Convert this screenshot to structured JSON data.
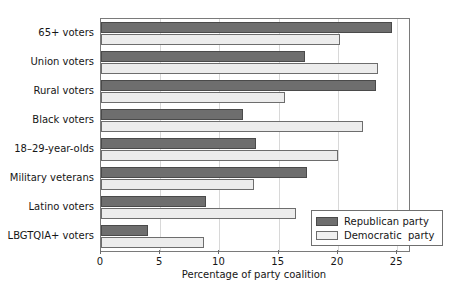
{
  "chart_data": {
    "type": "bar",
    "orientation": "horizontal",
    "title": "",
    "xlabel": "Percentage of party coalition",
    "ylabel": "",
    "xlim": [
      0,
      26
    ],
    "xticks": [
      0,
      5,
      10,
      15,
      20,
      25
    ],
    "grid": "vertical",
    "legend_position": "bottom-right",
    "categories": [
      "65+ voters",
      "Union voters",
      "Rural voters",
      "Black voters",
      "18–29-year-olds",
      "Military veterans",
      "Latino voters",
      "LBGTQIA+ voters"
    ],
    "series": [
      {
        "name": "Republican party",
        "color": "#6e6e6e",
        "values": [
          24.6,
          17.2,
          23.2,
          12.0,
          13.1,
          17.4,
          8.9,
          4.0
        ]
      },
      {
        "name": "Democratic  party",
        "color": "#ececec",
        "values": [
          20.2,
          23.4,
          15.5,
          22.1,
          20.0,
          12.9,
          16.5,
          8.7
        ]
      }
    ]
  },
  "legend": {
    "items": [
      {
        "label": "Republican party",
        "swatch": "dark-gray-swatch"
      },
      {
        "label": "Democratic  party",
        "swatch": "light-gray-swatch"
      }
    ]
  },
  "axis": {
    "x_title": "Percentage of party coalition",
    "x_tick_labels": [
      "0",
      "5",
      "10",
      "15",
      "20",
      "25"
    ]
  }
}
